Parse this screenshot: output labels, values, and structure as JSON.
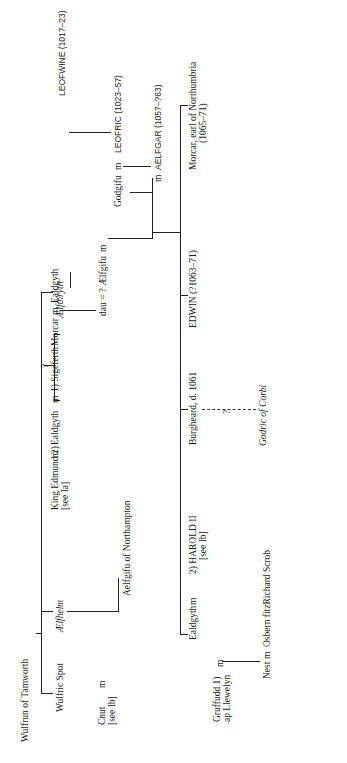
{
  "diagram": {
    "type": "genealogical-tree",
    "orientation": "rotated-90-ccw",
    "marriage_symbol": "m",
    "people": {
      "wulfrun": "Wulfrun of Tamworth",
      "wulfric": "Wulfric Spot",
      "aelfhelm": "Ælfhelm",
      "aelfthryth": "Ælfthryth",
      "cnut": "Cnut",
      "cnut_ref": "[see Ib]",
      "aelfgifu_n": "Aelfgifu of Northampton",
      "edmund": "King Edmund 2)",
      "edmund_ref": "[see Ia]",
      "ealdgyth1": "Ealdgyth",
      "sigeferth": "1) Sigeferth",
      "morcar1": "Morcar",
      "ealdgyth2": "Ealdgyth",
      "dau": "dau = ? Ælfgifu",
      "godgifu": "Godgifu",
      "leofwine": "LEOFWINE (1017–23)",
      "leofric": "LEOFRIC (1023–57)",
      "aelfgar": "AELFGAR (1057–?63)",
      "gruffudd": "Gruffudd 1)",
      "gruffudd2": "ap Llewelyn",
      "ealdgyth3": "Ealdgyth",
      "harold": "2) HAROLD II",
      "harold_ref": "[see Ib]",
      "burgheard": "Burgheard, d. 1061",
      "edwin": "EDWIN (?1063–71)",
      "morcar2": "Morcar, earl of Northumbria",
      "morcar2_dates": "(1065–71)",
      "nest": "Nest",
      "osbern": "Osbern fitzRichard Scrob",
      "godric": "Godric of Corbi"
    },
    "uncertain_mark": "?"
  }
}
